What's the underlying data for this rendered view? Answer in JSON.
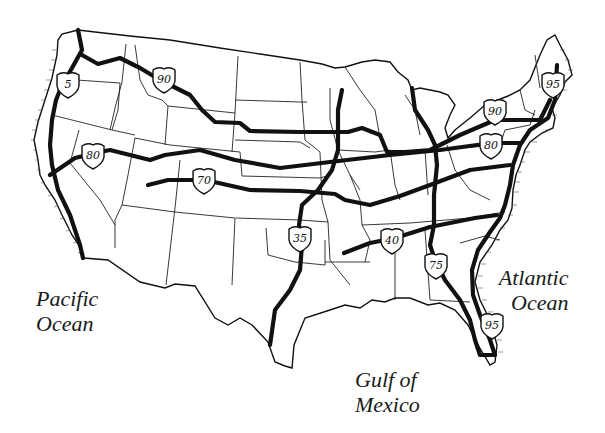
{
  "map": {
    "title": "Major U.S. Interstate Highways",
    "water_labels": [
      {
        "id": "pacific",
        "lines": [
          "Pacific",
          "Ocean"
        ],
        "x": 36,
        "y": 286
      },
      {
        "id": "atlantic",
        "lines": [
          "Atlantic",
          "Ocean"
        ],
        "x": 497,
        "y": 265
      },
      {
        "id": "gulf",
        "lines": [
          "Gulf of",
          "Mexico"
        ],
        "x": 355,
        "y": 370
      }
    ],
    "highways": [
      {
        "number": "5",
        "direction": "north-south",
        "shield": {
          "x": 68,
          "y": 84
        }
      },
      {
        "number": "90",
        "direction": "east-west",
        "shield": {
          "x": 164,
          "y": 79
        }
      },
      {
        "number": "90",
        "direction": "east-west",
        "shield": {
          "x": 495,
          "y": 111
        }
      },
      {
        "number": "80",
        "direction": "east-west",
        "shield": {
          "x": 93,
          "y": 155
        }
      },
      {
        "number": "80",
        "direction": "east-west",
        "shield": {
          "x": 491,
          "y": 145
        }
      },
      {
        "number": "70",
        "direction": "east-west",
        "shield": {
          "x": 204,
          "y": 180
        }
      },
      {
        "number": "35",
        "direction": "north-south",
        "shield": {
          "x": 300,
          "y": 238
        }
      },
      {
        "number": "40",
        "direction": "east-west",
        "shield": {
          "x": 392,
          "y": 240
        }
      },
      {
        "number": "75",
        "direction": "north-south",
        "shield": {
          "x": 436,
          "y": 265
        }
      },
      {
        "number": "95",
        "direction": "north-south",
        "shield": {
          "x": 553,
          "y": 84
        }
      },
      {
        "number": "95",
        "direction": "north-south",
        "shield": {
          "x": 492,
          "y": 325
        }
      }
    ],
    "colors": {
      "ink": "#111111",
      "background": "#ffffff"
    }
  }
}
